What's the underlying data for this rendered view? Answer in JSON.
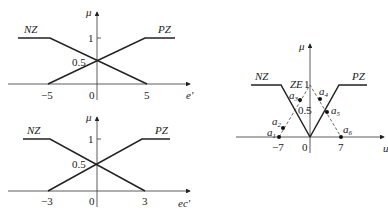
{
  "diagrams": {
    "top": {
      "y_axis_label": "μ",
      "x_axis_label": "e'",
      "sets": [
        {
          "name": "NZ",
          "label": "NZ"
        },
        {
          "name": "PZ",
          "label": "PZ"
        }
      ],
      "ticks": {
        "neg": "−5",
        "zero": "0",
        "pos": "5",
        "one": "1",
        "half": "0.5"
      }
    },
    "bottom": {
      "y_axis_label": "μ",
      "x_axis_label": "ec'",
      "sets": [
        {
          "name": "NZ",
          "label": "NZ"
        },
        {
          "name": "PZ",
          "label": "PZ"
        }
      ],
      "ticks": {
        "neg": "−3",
        "zero": "0",
        "pos": "3",
        "one": "1",
        "half": "0.5"
      }
    },
    "right": {
      "y_axis_label": "μ",
      "x_axis_label": "u",
      "sets": [
        {
          "name": "NZ",
          "label": "NZ"
        },
        {
          "name": "ZE",
          "label": "ZE"
        },
        {
          "name": "PZ",
          "label": "PZ"
        }
      ],
      "ticks": {
        "neg": "−7",
        "zero": "0",
        "pos": "7",
        "one": "1",
        "half": "0.5"
      },
      "points": [
        {
          "name": "a",
          "sub": "1"
        },
        {
          "name": "a",
          "sub": "2"
        },
        {
          "name": "a",
          "sub": "3"
        },
        {
          "name": "a",
          "sub": "4"
        },
        {
          "name": "a",
          "sub": "5"
        },
        {
          "name": "a",
          "sub": "6"
        }
      ]
    }
  }
}
